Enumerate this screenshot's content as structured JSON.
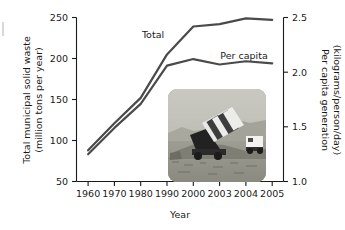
{
  "chart_data": {
    "type": "line",
    "title": "",
    "xlabel": "Year",
    "ylabel": "Total municipal solid waste (million tons per year)",
    "y2label": "Per capita generation (kilograms/person/day)",
    "categories": [
      "1960",
      "1970",
      "1980",
      "1990",
      "2000",
      "2003",
      "2004",
      "2005"
    ],
    "ylim": [
      50,
      250
    ],
    "y2lim": [
      1.0,
      2.5
    ],
    "yticks": [
      "50",
      "100",
      "150",
      "200",
      "250"
    ],
    "y2ticks": [
      "1.0",
      "1.5",
      "2.0",
      "2.5"
    ],
    "grid": false,
    "legend_position": "inline-labels",
    "series": [
      {
        "name": "Total",
        "axis": "left",
        "units": "million tons per year",
        "values": [
          88,
          121,
          152,
          205,
          239,
          242,
          249,
          247
        ]
      },
      {
        "name": "Per capita",
        "axis": "right",
        "units": "kilograms/person/day",
        "values": [
          1.25,
          1.49,
          1.71,
          2.06,
          2.12,
          2.07,
          2.1,
          2.08
        ]
      }
    ],
    "annotations": [
      {
        "text": "Total",
        "near_category": "1990"
      },
      {
        "text": "Per capita",
        "near_category": "2003"
      }
    ]
  },
  "axes": {
    "left_title_line1": "Total municipal solid waste",
    "left_title_line2": "(million tons per year)",
    "right_title_line1": "Per capita generation",
    "right_title_line2": "(kilograms/person/day)",
    "x_title": "Year"
  },
  "inset": {
    "caption": "dump-truck-unloading-at-landfill"
  }
}
